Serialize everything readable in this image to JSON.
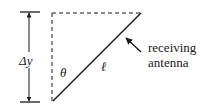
{
  "diagram": {
    "labels": {
      "delta_y": "Δy",
      "theta": "θ",
      "ell": "ℓ",
      "antenna_line1": "receiving",
      "antenna_line2": "antenna"
    },
    "colors": {
      "stroke": "#1a1a1a",
      "background": "#ffffff"
    }
  }
}
